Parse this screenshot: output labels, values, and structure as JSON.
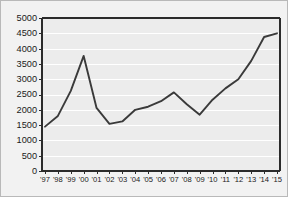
{
  "chart_data": {
    "type": "line",
    "title": "",
    "subtitle": "",
    "xlabel": "",
    "ylabel": "",
    "categories": [
      "'97",
      "'98",
      "'99",
      "'00",
      "'01",
      "'02",
      "'03",
      "'04",
      "'05",
      "'06",
      "'07",
      "'08",
      "'09",
      "'10",
      "'11",
      "'12",
      "'13",
      "'14",
      "'15"
    ],
    "values": [
      1450,
      1800,
      2620,
      3760,
      2060,
      1540,
      1620,
      2000,
      2100,
      2280,
      2570,
      2180,
      1840,
      2330,
      2700,
      3000,
      3600,
      4380,
      4500
    ],
    "series": [
      {
        "name": "series-1",
        "values": [
          1450,
          1800,
          2620,
          3760,
          2060,
          1540,
          1620,
          2000,
          2100,
          2280,
          2570,
          2180,
          1840,
          2330,
          2700,
          3000,
          3600,
          4380,
          4500
        ]
      }
    ],
    "ylim": [
      0,
      5000
    ],
    "yticks": [
      0,
      500,
      1000,
      1500,
      2000,
      2500,
      3000,
      3500,
      4000,
      4500,
      5000
    ],
    "ytick_labels": [
      "0",
      "500",
      "1000",
      "1500",
      "2000",
      "2500",
      "3000",
      "3500",
      "4000",
      "4500",
      "5000"
    ],
    "xtick_labels": [
      "'97",
      "'98",
      "'99",
      "'00",
      "'01",
      "'02",
      "'03",
      "'04",
      "'05",
      "'06",
      "'07",
      "'08",
      "'09",
      "'10",
      "'11",
      "'12",
      "'13",
      "'14",
      "'15"
    ],
    "grid": true,
    "grid_axis": "y",
    "legend": false,
    "legend_position": "none",
    "annotations": [],
    "colors": {
      "line": "#3a3a3a",
      "grid": "#ffffff",
      "plot_background": "#ececec",
      "figure_background": "#f2f2f2",
      "axis": "#2b2b2b",
      "border": "#b9b9b9",
      "tick_text": "#1a1a1a"
    }
  }
}
